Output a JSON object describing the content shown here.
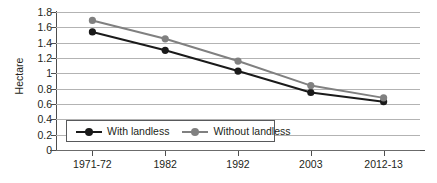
{
  "chart_data": {
    "type": "line",
    "title": "",
    "xlabel": "",
    "ylabel": "Hectare",
    "categories": [
      "1971-72",
      "1982",
      "1992",
      "2003",
      "2012-13"
    ],
    "series": [
      {
        "name": "With landless",
        "color": "#1a1a1a",
        "marker": "circle",
        "values": [
          1.54,
          1.3,
          1.03,
          0.75,
          0.63
        ]
      },
      {
        "name": "Without landless",
        "color": "#808080",
        "marker": "circle",
        "values": [
          1.69,
          1.45,
          1.16,
          0.84,
          0.68
        ]
      }
    ],
    "ylim": [
      0,
      1.8
    ],
    "y_ticks": [
      "0",
      "0.2",
      "0.4",
      "0.6",
      "0.8",
      "1",
      "1.2",
      "1.4",
      "1.6",
      "1.8"
    ],
    "y_tick_values": [
      0,
      0.2,
      0.4,
      0.6,
      0.8,
      1,
      1.2,
      1.4,
      1.6,
      1.8
    ],
    "grid": true,
    "grid_color": "#b3b3b3",
    "legend_position": "inside-bottom-left",
    "background": "#ffffff",
    "axis_color": "#4d4d4d"
  }
}
